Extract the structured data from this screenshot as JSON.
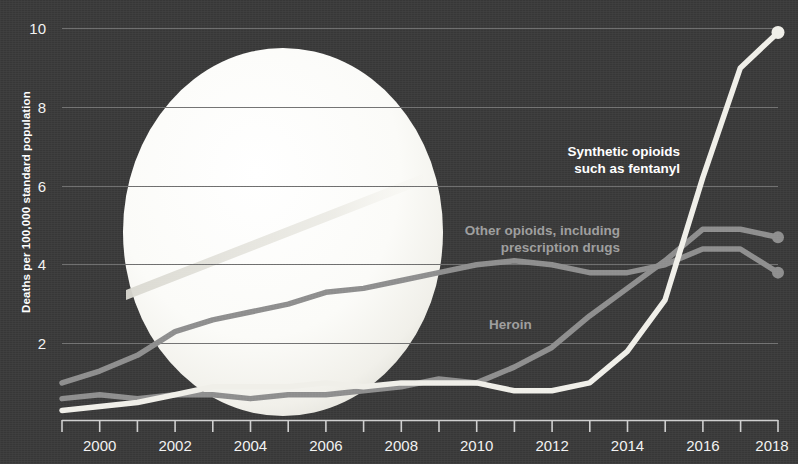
{
  "figure": {
    "background_color": "#373737",
    "accent_white": "#f0efe9",
    "accent_gray": "#8d8d8d",
    "gridline_color": "#6a6a6a"
  },
  "axes": {
    "y_title": "Deaths per 100,000 standard population",
    "y_ticks": [
      "2",
      "4",
      "6",
      "8",
      "10"
    ],
    "y_tick_values": [
      2,
      4,
      6,
      8,
      10
    ],
    "x_ticks": [
      "2000",
      "2002",
      "2004",
      "2006",
      "2008",
      "2010",
      "2012",
      "2014",
      "2016",
      "2018"
    ],
    "x_tick_values": [
      2000,
      2002,
      2004,
      2006,
      2008,
      2010,
      2012,
      2014,
      2016,
      2018
    ]
  },
  "annotations": {
    "synthetic": "Synthetic opioids\nsuch as fentanyl",
    "other": "Other opioids, including\nprescription drugs",
    "heroin": "Heroin"
  },
  "decoration": {
    "pill_name": "pill-graphic"
  },
  "chart_data": {
    "type": "line",
    "title": "",
    "xlabel": "",
    "ylabel": "Deaths per 100,000 standard population",
    "xlim": [
      1999,
      2018
    ],
    "ylim": [
      0,
      10.8
    ],
    "grid": "horizontal",
    "legend": "inline-annotations",
    "x": [
      1999,
      2000,
      2001,
      2002,
      2003,
      2004,
      2005,
      2006,
      2007,
      2008,
      2009,
      2010,
      2011,
      2012,
      2013,
      2014,
      2015,
      2016,
      2017,
      2018
    ],
    "series": [
      {
        "name": "Synthetic opioids such as fentanyl",
        "color": "#f0efe9",
        "label_style": "bright",
        "values": [
          0.3,
          0.4,
          0.5,
          0.7,
          0.9,
          0.9,
          0.9,
          1.0,
          0.9,
          1.0,
          1.0,
          1.0,
          0.8,
          0.8,
          1.0,
          1.8,
          3.1,
          6.2,
          9.0,
          9.9
        ]
      },
      {
        "name": "Other opioids, including prescription drugs",
        "color": "#8d8d8d",
        "label_style": "dim",
        "values": [
          1.0,
          1.3,
          1.7,
          2.3,
          2.6,
          2.8,
          3.0,
          3.3,
          3.4,
          3.6,
          3.8,
          4.0,
          4.1,
          4.0,
          3.8,
          3.8,
          4.0,
          4.4,
          4.4,
          3.8
        ]
      },
      {
        "name": "Heroin",
        "color": "#8d8d8d",
        "label_style": "dim",
        "values": [
          0.6,
          0.7,
          0.6,
          0.7,
          0.7,
          0.6,
          0.7,
          0.7,
          0.8,
          0.9,
          1.1,
          1.0,
          1.4,
          1.9,
          2.7,
          3.4,
          4.1,
          4.9,
          4.9,
          4.7
        ]
      }
    ]
  }
}
